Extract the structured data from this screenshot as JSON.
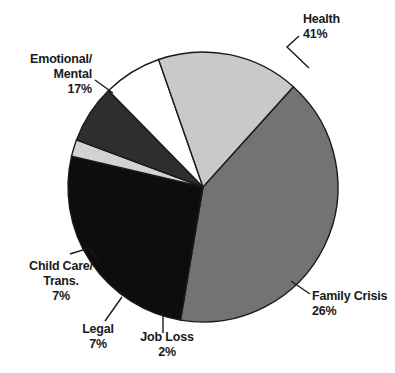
{
  "chart_data": {
    "type": "pie",
    "title": "",
    "subtitle": "",
    "xlabel": "",
    "ylabel": "",
    "legend_position": "none",
    "grid": false,
    "label_format": "name + percent",
    "categories": [
      "Health",
      "Family Crisis",
      "Job Loss",
      "Legal",
      "Child Care/ Trans.",
      "Emotional/ Mental"
    ],
    "values": [
      41,
      26,
      2,
      7,
      7,
      17
    ],
    "units": "percent",
    "total": 100,
    "start_angle_deg": -48,
    "direction": "clockwise",
    "slices": [
      {
        "name": "Health",
        "label_line1": "Health",
        "label_line2": "41%",
        "value": 41,
        "percent": "41%",
        "color": "#737373",
        "label_align": "left"
      },
      {
        "name": "Family Crisis",
        "label_line1": "Family Crisis",
        "label_line2": "26%",
        "value": 26,
        "percent": "26%",
        "color": "#0d0d0d",
        "label_align": "left"
      },
      {
        "name": "Job Loss",
        "label_line1": "Job Loss",
        "label_line2": "2%",
        "value": 2,
        "percent": "2%",
        "color": "#d2d2d2",
        "label_align": "center"
      },
      {
        "name": "Legal",
        "label_line1": "Legal",
        "label_line2": "7%",
        "value": 7,
        "percent": "7%",
        "color": "#2e2e2e",
        "label_align": "center"
      },
      {
        "name": "Child Care/ Trans.",
        "label_line1": "Child Care/",
        "label_line2": "Trans.",
        "label_line3": "7%",
        "value": 7,
        "percent": "7%",
        "color": "#ffffff",
        "label_align": "center"
      },
      {
        "name": "Emotional/ Mental",
        "label_line1": "Emotional/",
        "label_line2": "Mental",
        "label_line3": "17%",
        "value": 17,
        "percent": "17%",
        "color": "#c9c9c9",
        "label_align": "right"
      }
    ],
    "geometry": {
      "center_x": 203,
      "center_y": 187,
      "radius": 135,
      "outline_color": "#1a1a1a"
    }
  }
}
